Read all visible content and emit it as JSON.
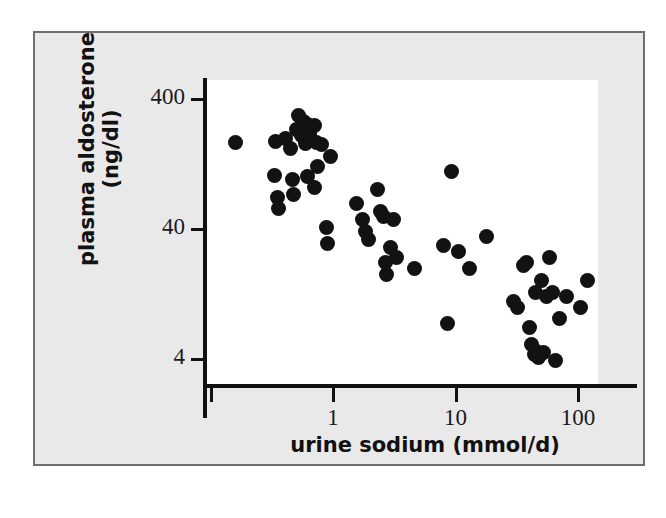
{
  "figure": {
    "background_color": "#e9e9e9",
    "panel_color": "#ffffff",
    "frame_color": "#6e6e6e",
    "point_color": "#121212",
    "caption_partial": ""
  },
  "chart_data": {
    "type": "scatter",
    "title": "",
    "xlabel": "urine sodium (mmol/d)",
    "ylabel_line1": "plasma aldosterone",
    "ylabel_line2": "(ng/dl)",
    "ylabel": "plasma aldosterone (ng/dl)",
    "xscale": "log",
    "yscale": "log",
    "xlim": [
      0.1,
      200
    ],
    "ylim": [
      3.2,
      560
    ],
    "grid": false,
    "legend": null,
    "xticks": [
      0.1,
      1,
      10,
      100
    ],
    "xtick_labels": [
      "",
      "1",
      "10",
      "100"
    ],
    "yticks": [
      4,
      40,
      400
    ],
    "ytick_labels": [
      "4",
      "40",
      "400"
    ],
    "n_points": 62,
    "points": [
      {
        "x": 0.16,
        "y": 186
      },
      {
        "x": 0.34,
        "y": 189
      },
      {
        "x": 0.41,
        "y": 200
      },
      {
        "x": 0.45,
        "y": 166
      },
      {
        "x": 0.5,
        "y": 232
      },
      {
        "x": 0.52,
        "y": 296
      },
      {
        "x": 0.55,
        "y": 210
      },
      {
        "x": 0.57,
        "y": 268
      },
      {
        "x": 0.6,
        "y": 183
      },
      {
        "x": 0.62,
        "y": 253
      },
      {
        "x": 0.64,
        "y": 215
      },
      {
        "x": 0.66,
        "y": 198
      },
      {
        "x": 0.7,
        "y": 252
      },
      {
        "x": 0.74,
        "y": 186
      },
      {
        "x": 0.8,
        "y": 179
      },
      {
        "x": 0.95,
        "y": 145
      },
      {
        "x": 0.33,
        "y": 103
      },
      {
        "x": 0.35,
        "y": 70
      },
      {
        "x": 0.36,
        "y": 58
      },
      {
        "x": 0.47,
        "y": 96
      },
      {
        "x": 0.48,
        "y": 74
      },
      {
        "x": 0.62,
        "y": 101
      },
      {
        "x": 0.7,
        "y": 84
      },
      {
        "x": 0.75,
        "y": 120
      },
      {
        "x": 0.88,
        "y": 41
      },
      {
        "x": 0.9,
        "y": 31
      },
      {
        "x": 1.55,
        "y": 63
      },
      {
        "x": 1.75,
        "y": 47
      },
      {
        "x": 1.85,
        "y": 38
      },
      {
        "x": 1.95,
        "y": 33
      },
      {
        "x": 2.3,
        "y": 80
      },
      {
        "x": 2.45,
        "y": 55
      },
      {
        "x": 2.6,
        "y": 50
      },
      {
        "x": 2.7,
        "y": 22
      },
      {
        "x": 2.75,
        "y": 18
      },
      {
        "x": 2.95,
        "y": 29
      },
      {
        "x": 3.1,
        "y": 47
      },
      {
        "x": 3.3,
        "y": 24
      },
      {
        "x": 4.6,
        "y": 20
      },
      {
        "x": 8.0,
        "y": 30
      },
      {
        "x": 8.6,
        "y": 7.5
      },
      {
        "x": 9.2,
        "y": 110
      },
      {
        "x": 10.5,
        "y": 27
      },
      {
        "x": 13.0,
        "y": 20
      },
      {
        "x": 18.0,
        "y": 35
      },
      {
        "x": 30.0,
        "y": 11
      },
      {
        "x": 32.0,
        "y": 10
      },
      {
        "x": 36.0,
        "y": 21
      },
      {
        "x": 38.0,
        "y": 22
      },
      {
        "x": 40.0,
        "y": 7.0
      },
      {
        "x": 42.0,
        "y": 5.2
      },
      {
        "x": 44.0,
        "y": 4.3
      },
      {
        "x": 45.0,
        "y": 13
      },
      {
        "x": 46.0,
        "y": 4.6
      },
      {
        "x": 48.0,
        "y": 4.1
      },
      {
        "x": 50.0,
        "y": 16
      },
      {
        "x": 52.0,
        "y": 4.5
      },
      {
        "x": 55.0,
        "y": 12
      },
      {
        "x": 58.0,
        "y": 24
      },
      {
        "x": 62.0,
        "y": 13
      },
      {
        "x": 66.0,
        "y": 3.9
      },
      {
        "x": 70.0,
        "y": 8.2
      },
      {
        "x": 80.0,
        "y": 12
      },
      {
        "x": 105.0,
        "y": 10
      },
      {
        "x": 120.0,
        "y": 16
      }
    ]
  }
}
